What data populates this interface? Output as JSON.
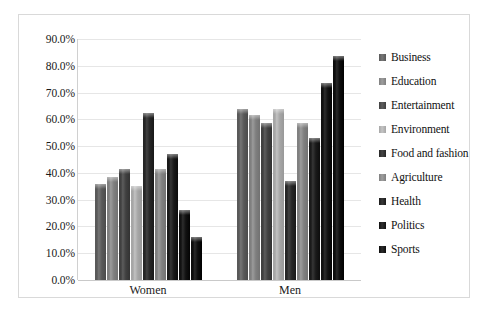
{
  "chart_data": {
    "type": "bar",
    "title": "",
    "subtitle": "",
    "xlabel": "",
    "ylabel": "",
    "categories": [
      "Women",
      "Men"
    ],
    "ylim": [
      0,
      0.9
    ],
    "y_ticks": [
      0.9,
      0.8,
      0.7,
      0.6,
      0.5,
      0.4,
      0.3,
      0.2,
      0.1,
      0.0
    ],
    "y_tick_labels": [
      "90.0%",
      "80.0%",
      "70.0%",
      "60.0%",
      "50.0%",
      "40.0%",
      "30.0%",
      "20.0%",
      "10.0%",
      "0.0%"
    ],
    "grid": true,
    "legend_position": "right",
    "series": [
      {
        "name": "Business",
        "color": "#595959",
        "values": [
          0.36,
          0.64
        ]
      },
      {
        "name": "Education",
        "color": "#7f7f7f",
        "values": [
          0.385,
          0.615
        ]
      },
      {
        "name": "Entertainment",
        "color": "#404040",
        "values": [
          0.415,
          0.585
        ]
      },
      {
        "name": "Environment",
        "color": "#a6a6a6",
        "values": [
          0.35,
          0.64
        ]
      },
      {
        "name": "Food and fashion",
        "color": "#262626",
        "values": [
          0.625,
          0.37
        ]
      },
      {
        "name": "Agriculture",
        "color": "#808080",
        "values": [
          0.415,
          0.585
        ]
      },
      {
        "name": "Health",
        "color": "#1a1a1a",
        "values": [
          0.47,
          0.53
        ]
      },
      {
        "name": "Politics",
        "color": "#111111",
        "values": [
          0.26,
          0.735
        ]
      },
      {
        "name": "Sports",
        "color": "#0d0d0d",
        "values": [
          0.16,
          0.835
        ]
      }
    ]
  },
  "legend": {
    "items": [
      {
        "label": "Business"
      },
      {
        "label": "Education"
      },
      {
        "label": "Entertainment"
      },
      {
        "label": "Environment"
      },
      {
        "label": "Food and fashion"
      },
      {
        "label": "Agriculture"
      },
      {
        "label": "Health"
      },
      {
        "label": "Politics"
      },
      {
        "label": "Sports"
      }
    ]
  }
}
